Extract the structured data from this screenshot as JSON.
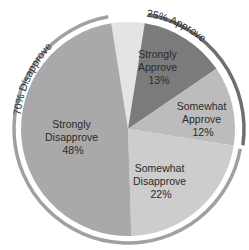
{
  "chart_data": {
    "type": "pie",
    "title": "",
    "slices": [
      {
        "label": "",
        "value": 5,
        "color": "#e4e4e4"
      },
      {
        "label": "Strongly Approve",
        "value": 13,
        "color": "#7b7b7b"
      },
      {
        "label": "Somewhat Approve",
        "value": 12,
        "color": "#bcbcbc"
      },
      {
        "label": "Somewhat Disapprove",
        "value": 22,
        "color": "#cdcdcd"
      },
      {
        "label": "Strongly Disapprove",
        "value": 48,
        "color": "#a9a9a9"
      }
    ],
    "groups": [
      {
        "label": "25% Approve",
        "value": 25,
        "color": "#6f6f6f"
      },
      {
        "label": "70% Disapprove",
        "value": 70,
        "color": "#a0a0a0"
      }
    ]
  },
  "labels": {
    "strongly_approve": [
      "Strongly",
      "Approve",
      "13%"
    ],
    "somewhat_approve": [
      "Somewhat",
      "Approve",
      "12%"
    ],
    "somewhat_disapprove": [
      "Somewhat",
      "Disapprove",
      "22%"
    ],
    "strongly_disapprove": [
      "Strongly",
      "Disapprove",
      "48%"
    ],
    "approve_arc": "25% Approve",
    "disapprove_arc": "70% Disapprove"
  }
}
